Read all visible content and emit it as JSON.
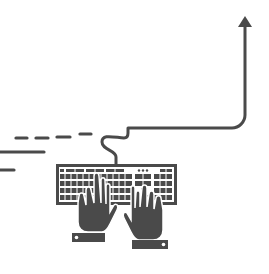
{
  "illustration": {
    "title": "Typing on keyboard with rising arrow",
    "colors": {
      "background": "#ffffff",
      "ink": "#4a4a4a",
      "key_fill": "#ffffff"
    },
    "elements": {
      "arrow": "up-arrow-icon",
      "cable": "cable-line",
      "keyboard": "keyboard-icon",
      "left_hand": "left-hand-icon",
      "right_hand": "right-hand-icon",
      "motion_lines": "speed-lines"
    }
  }
}
